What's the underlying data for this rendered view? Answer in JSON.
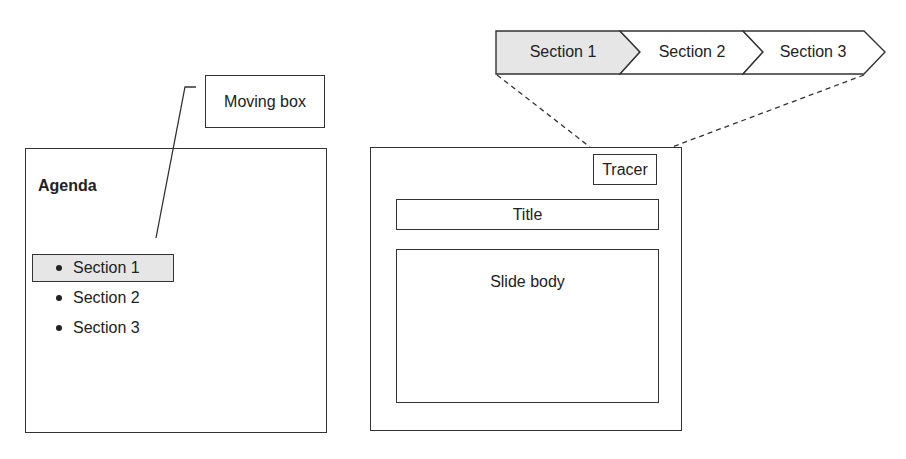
{
  "left_panel": {
    "agenda_title": "Agenda",
    "items": [
      {
        "label": "Section 1",
        "highlighted": true
      },
      {
        "label": "Section 2",
        "highlighted": false
      },
      {
        "label": "Section 3",
        "highlighted": false
      }
    ],
    "callout_label": "Moving box",
    "highlight_color": "#e6e6e6"
  },
  "breadcrumb": {
    "items": [
      {
        "label": "Section 1",
        "active": true
      },
      {
        "label": "Section 2",
        "active": false
      },
      {
        "label": "Section 3",
        "active": false
      }
    ],
    "active_color": "#e6e6e6"
  },
  "slide": {
    "tracer_label": "Tracer",
    "title_label": "Title",
    "body_label": "Slide body"
  }
}
